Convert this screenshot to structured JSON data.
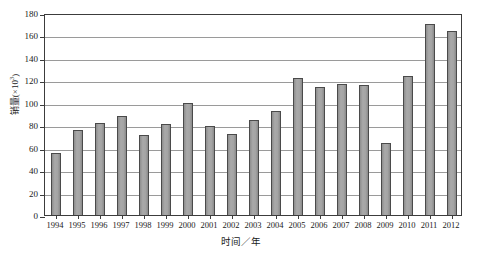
{
  "chart_data": {
    "type": "bar",
    "title": "",
    "xlabel": "时间／年",
    "ylabel": "销量(×10³)",
    "ylabel_base": "销量(×10",
    "ylabel_exp": "3",
    "ylabel_tail": ")",
    "ylim": [
      0,
      180
    ],
    "ytick_step": 20,
    "ytick_labels": [
      "180",
      "160",
      "140",
      "120",
      "100",
      "80",
      "60",
      "40",
      "20",
      "0"
    ],
    "ytick_values": [
      180,
      160,
      140,
      120,
      100,
      80,
      60,
      40,
      20,
      0
    ],
    "grid": true,
    "legend": "none",
    "categories": [
      "1994",
      "1995",
      "1996",
      "1997",
      "1998",
      "1999",
      "2000",
      "2001",
      "2002",
      "2003",
      "2004",
      "2005",
      "2006",
      "2007",
      "2008",
      "2009",
      "2010",
      "2011",
      "2012"
    ],
    "values": [
      55,
      76,
      82,
      88,
      71,
      81,
      100,
      79,
      72,
      85,
      93,
      122,
      114,
      117,
      116,
      64,
      124,
      170,
      164
    ],
    "series": [
      {
        "name": "销量",
        "values": [
          55,
          76,
          82,
          88,
          71,
          81,
          100,
          79,
          72,
          85,
          93,
          122,
          114,
          117,
          116,
          64,
          124,
          170,
          164
        ]
      }
    ],
    "colors": {
      "bar_fill": "#9d9d9d",
      "bar_stroke": "#4a4a4a",
      "gridline": "#9a9a9a",
      "frame": "#3c3c3c",
      "background": "#ffffff",
      "text": "#1a1a1a"
    }
  }
}
